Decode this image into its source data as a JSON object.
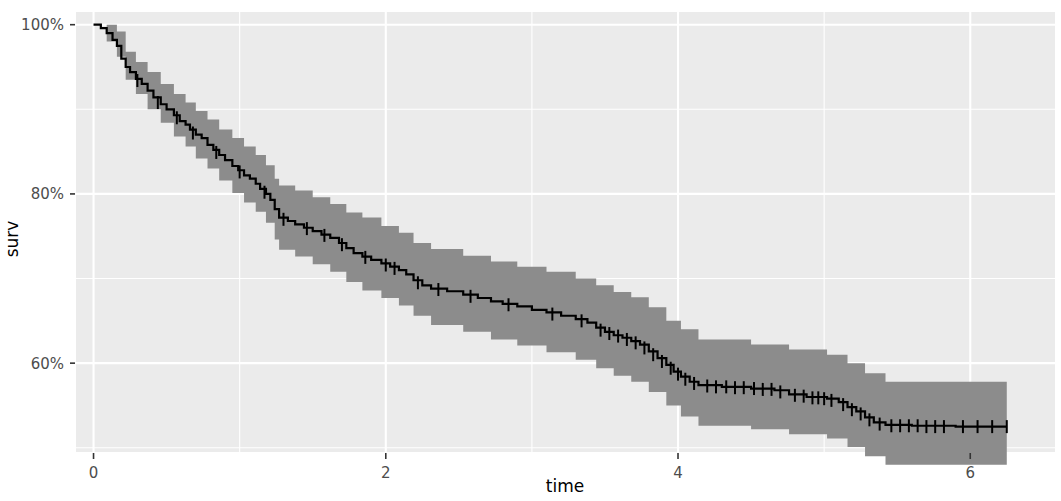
{
  "chart_data": {
    "type": "line",
    "subtype": "kaplan-meier-survival-curve",
    "title": "",
    "xlabel": "time",
    "ylabel": "surv",
    "xlim": [
      -0.12,
      6.58
    ],
    "ylim": [
      0.495,
      1.015
    ],
    "x_ticks": [
      0,
      2,
      4,
      6
    ],
    "x_tick_labels": [
      "0",
      "2",
      "4",
      "6"
    ],
    "y_ticks": [
      0.6,
      0.8,
      1.0
    ],
    "y_tick_labels": [
      "60%",
      "80%",
      "100%"
    ],
    "y_minor_ticks": [
      0.5,
      0.7,
      0.9
    ],
    "x_minor_ticks": [
      1,
      3,
      5
    ],
    "grid": true,
    "grid_color": "#ffffff",
    "panel_color": "#ebebeb",
    "legend": "none",
    "line_color": "#000000",
    "line_width": 2.2,
    "ci_band_color": "#8c8c8c",
    "ci_band_opacity": 1.0,
    "censor_mark": "+",
    "series": [
      {
        "name": "surv",
        "step_points": [
          [
            0.0,
            1.0
          ],
          [
            0.05,
            0.996
          ],
          [
            0.09,
            0.99
          ],
          [
            0.13,
            0.982
          ],
          [
            0.16,
            0.975
          ],
          [
            0.19,
            0.96
          ],
          [
            0.22,
            0.95
          ],
          [
            0.25,
            0.944
          ],
          [
            0.29,
            0.936
          ],
          [
            0.33,
            0.93
          ],
          [
            0.37,
            0.922
          ],
          [
            0.41,
            0.914
          ],
          [
            0.46,
            0.906
          ],
          [
            0.5,
            0.9
          ],
          [
            0.55,
            0.893
          ],
          [
            0.59,
            0.886
          ],
          [
            0.63,
            0.882
          ],
          [
            0.66,
            0.876
          ],
          [
            0.7,
            0.87
          ],
          [
            0.74,
            0.866
          ],
          [
            0.78,
            0.858
          ],
          [
            0.82,
            0.852
          ],
          [
            0.86,
            0.846
          ],
          [
            0.9,
            0.84
          ],
          [
            0.95,
            0.833
          ],
          [
            0.99,
            0.828
          ],
          [
            1.03,
            0.822
          ],
          [
            1.07,
            0.818
          ],
          [
            1.11,
            0.812
          ],
          [
            1.14,
            0.806
          ],
          [
            1.18,
            0.8
          ],
          [
            1.21,
            0.793
          ],
          [
            1.24,
            0.782
          ],
          [
            1.27,
            0.772
          ],
          [
            1.33,
            0.768
          ],
          [
            1.38,
            0.764
          ],
          [
            1.44,
            0.76
          ],
          [
            1.5,
            0.756
          ],
          [
            1.56,
            0.752
          ],
          [
            1.62,
            0.748
          ],
          [
            1.68,
            0.742
          ],
          [
            1.73,
            0.736
          ],
          [
            1.78,
            0.73
          ],
          [
            1.84,
            0.726
          ],
          [
            1.9,
            0.722
          ],
          [
            1.97,
            0.718
          ],
          [
            2.03,
            0.714
          ],
          [
            2.09,
            0.71
          ],
          [
            2.14,
            0.705
          ],
          [
            2.19,
            0.698
          ],
          [
            2.25,
            0.692
          ],
          [
            2.31,
            0.688
          ],
          [
            2.42,
            0.685
          ],
          [
            2.53,
            0.681
          ],
          [
            2.63,
            0.677
          ],
          [
            2.72,
            0.673
          ],
          [
            2.8,
            0.67
          ],
          [
            2.9,
            0.667
          ],
          [
            3.0,
            0.663
          ],
          [
            3.1,
            0.66
          ],
          [
            3.2,
            0.656
          ],
          [
            3.3,
            0.652
          ],
          [
            3.38,
            0.648
          ],
          [
            3.44,
            0.642
          ],
          [
            3.5,
            0.637
          ],
          [
            3.56,
            0.633
          ],
          [
            3.62,
            0.63
          ],
          [
            3.68,
            0.626
          ],
          [
            3.74,
            0.622
          ],
          [
            3.8,
            0.614
          ],
          [
            3.86,
            0.606
          ],
          [
            3.92,
            0.598
          ],
          [
            3.97,
            0.59
          ],
          [
            4.02,
            0.584
          ],
          [
            4.08,
            0.578
          ],
          [
            4.14,
            0.574
          ],
          [
            4.3,
            0.572
          ],
          [
            4.5,
            0.57
          ],
          [
            4.66,
            0.568
          ],
          [
            4.76,
            0.563
          ],
          [
            4.88,
            0.56
          ],
          [
            5.02,
            0.558
          ],
          [
            5.1,
            0.554
          ],
          [
            5.16,
            0.548
          ],
          [
            5.22,
            0.543
          ],
          [
            5.28,
            0.536
          ],
          [
            5.34,
            0.53
          ],
          [
            5.42,
            0.527
          ],
          [
            5.6,
            0.526
          ],
          [
            5.9,
            0.525
          ],
          [
            6.25,
            0.525
          ]
        ],
        "ci_lower": [
          [
            0.0,
            1.0
          ],
          [
            0.09,
            0.98
          ],
          [
            0.16,
            0.962
          ],
          [
            0.22,
            0.935
          ],
          [
            0.29,
            0.918
          ],
          [
            0.37,
            0.9
          ],
          [
            0.46,
            0.884
          ],
          [
            0.55,
            0.868
          ],
          [
            0.63,
            0.856
          ],
          [
            0.7,
            0.842
          ],
          [
            0.78,
            0.83
          ],
          [
            0.86,
            0.816
          ],
          [
            0.95,
            0.801
          ],
          [
            1.03,
            0.79
          ],
          [
            1.11,
            0.779
          ],
          [
            1.18,
            0.766
          ],
          [
            1.24,
            0.746
          ],
          [
            1.27,
            0.734
          ],
          [
            1.38,
            0.726
          ],
          [
            1.5,
            0.717
          ],
          [
            1.62,
            0.708
          ],
          [
            1.73,
            0.696
          ],
          [
            1.84,
            0.686
          ],
          [
            1.97,
            0.677
          ],
          [
            2.09,
            0.668
          ],
          [
            2.19,
            0.656
          ],
          [
            2.31,
            0.645
          ],
          [
            2.53,
            0.637
          ],
          [
            2.72,
            0.628
          ],
          [
            2.9,
            0.621
          ],
          [
            3.1,
            0.613
          ],
          [
            3.3,
            0.604
          ],
          [
            3.44,
            0.594
          ],
          [
            3.56,
            0.585
          ],
          [
            3.68,
            0.578
          ],
          [
            3.8,
            0.566
          ],
          [
            3.92,
            0.55
          ],
          [
            4.02,
            0.537
          ],
          [
            4.14,
            0.526
          ],
          [
            4.5,
            0.522
          ],
          [
            4.76,
            0.516
          ],
          [
            5.02,
            0.511
          ],
          [
            5.16,
            0.501
          ],
          [
            5.28,
            0.49
          ],
          [
            5.42,
            0.48
          ],
          [
            6.25,
            0.478
          ]
        ],
        "ci_upper": [
          [
            0.0,
            1.0
          ],
          [
            0.09,
            1.0
          ],
          [
            0.16,
            0.992
          ],
          [
            0.22,
            0.968
          ],
          [
            0.29,
            0.956
          ],
          [
            0.37,
            0.944
          ],
          [
            0.46,
            0.93
          ],
          [
            0.55,
            0.918
          ],
          [
            0.63,
            0.908
          ],
          [
            0.7,
            0.898
          ],
          [
            0.78,
            0.888
          ],
          [
            0.86,
            0.876
          ],
          [
            0.95,
            0.866
          ],
          [
            1.03,
            0.856
          ],
          [
            1.11,
            0.846
          ],
          [
            1.18,
            0.834
          ],
          [
            1.24,
            0.818
          ],
          [
            1.27,
            0.81
          ],
          [
            1.38,
            0.804
          ],
          [
            1.5,
            0.796
          ],
          [
            1.62,
            0.788
          ],
          [
            1.73,
            0.778
          ],
          [
            1.84,
            0.772
          ],
          [
            1.97,
            0.762
          ],
          [
            2.09,
            0.754
          ],
          [
            2.19,
            0.742
          ],
          [
            2.31,
            0.735
          ],
          [
            2.53,
            0.727
          ],
          [
            2.72,
            0.72
          ],
          [
            2.9,
            0.714
          ],
          [
            3.1,
            0.708
          ],
          [
            3.3,
            0.7
          ],
          [
            3.44,
            0.692
          ],
          [
            3.56,
            0.684
          ],
          [
            3.68,
            0.678
          ],
          [
            3.8,
            0.666
          ],
          [
            3.92,
            0.65
          ],
          [
            4.02,
            0.64
          ],
          [
            4.14,
            0.628
          ],
          [
            4.5,
            0.622
          ],
          [
            4.76,
            0.616
          ],
          [
            5.02,
            0.61
          ],
          [
            5.16,
            0.6
          ],
          [
            5.28,
            0.588
          ],
          [
            5.42,
            0.578
          ],
          [
            6.25,
            0.576
          ]
        ],
        "censor_points": [
          [
            0.3,
            0.934
          ],
          [
            0.44,
            0.908
          ],
          [
            0.57,
            0.89
          ],
          [
            0.68,
            0.872
          ],
          [
            0.84,
            0.849
          ],
          [
            1.0,
            0.826
          ],
          [
            1.17,
            0.802
          ],
          [
            1.3,
            0.77
          ],
          [
            1.46,
            0.759
          ],
          [
            1.58,
            0.751
          ],
          [
            1.7,
            0.74
          ],
          [
            1.86,
            0.725
          ],
          [
            2.0,
            0.716
          ],
          [
            2.06,
            0.712
          ],
          [
            2.22,
            0.695
          ],
          [
            2.36,
            0.687
          ],
          [
            2.58,
            0.679
          ],
          [
            2.84,
            0.669
          ],
          [
            3.14,
            0.658
          ],
          [
            3.34,
            0.65
          ],
          [
            3.47,
            0.639
          ],
          [
            3.53,
            0.635
          ],
          [
            3.59,
            0.632
          ],
          [
            3.65,
            0.628
          ],
          [
            3.71,
            0.624
          ],
          [
            3.77,
            0.618
          ],
          [
            3.83,
            0.61
          ],
          [
            3.89,
            0.602
          ],
          [
            3.95,
            0.594
          ],
          [
            4.0,
            0.587
          ],
          [
            4.05,
            0.581
          ],
          [
            4.11,
            0.576
          ],
          [
            4.2,
            0.573
          ],
          [
            4.26,
            0.572
          ],
          [
            4.33,
            0.572
          ],
          [
            4.39,
            0.571
          ],
          [
            4.45,
            0.571
          ],
          [
            4.52,
            0.57
          ],
          [
            4.58,
            0.569
          ],
          [
            4.64,
            0.569
          ],
          [
            4.7,
            0.566
          ],
          [
            4.8,
            0.562
          ],
          [
            4.86,
            0.561
          ],
          [
            4.92,
            0.559
          ],
          [
            4.96,
            0.559
          ],
          [
            5.0,
            0.558
          ],
          [
            5.05,
            0.556
          ],
          [
            5.13,
            0.551
          ],
          [
            5.19,
            0.545
          ],
          [
            5.25,
            0.54
          ],
          [
            5.31,
            0.533
          ],
          [
            5.38,
            0.528
          ],
          [
            5.46,
            0.526
          ],
          [
            5.52,
            0.526
          ],
          [
            5.58,
            0.526
          ],
          [
            5.64,
            0.526
          ],
          [
            5.7,
            0.525
          ],
          [
            5.76,
            0.525
          ],
          [
            5.82,
            0.525
          ],
          [
            5.95,
            0.525
          ],
          [
            6.05,
            0.525
          ],
          [
            6.15,
            0.525
          ],
          [
            6.25,
            0.525
          ]
        ]
      }
    ]
  },
  "axes": {
    "y_title": "surv",
    "x_title": "time"
  }
}
